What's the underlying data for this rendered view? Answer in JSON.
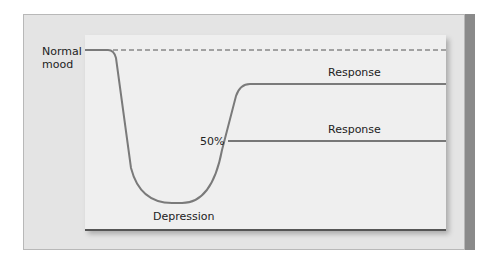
{
  "diagram": {
    "labels": {
      "normal_mood_line1": "Normal",
      "normal_mood_line2": "mood",
      "response_top": "Response",
      "response_partial": "Response",
      "fifty_percent": "50%",
      "depression": "Depression"
    },
    "colors": {
      "curve": "#7a7a7a",
      "dashed_baseline": "#555555",
      "outer_panel": "#e4e4e4",
      "inner_panel": "#efefef",
      "right_edge": "#8a8a8a"
    }
  }
}
